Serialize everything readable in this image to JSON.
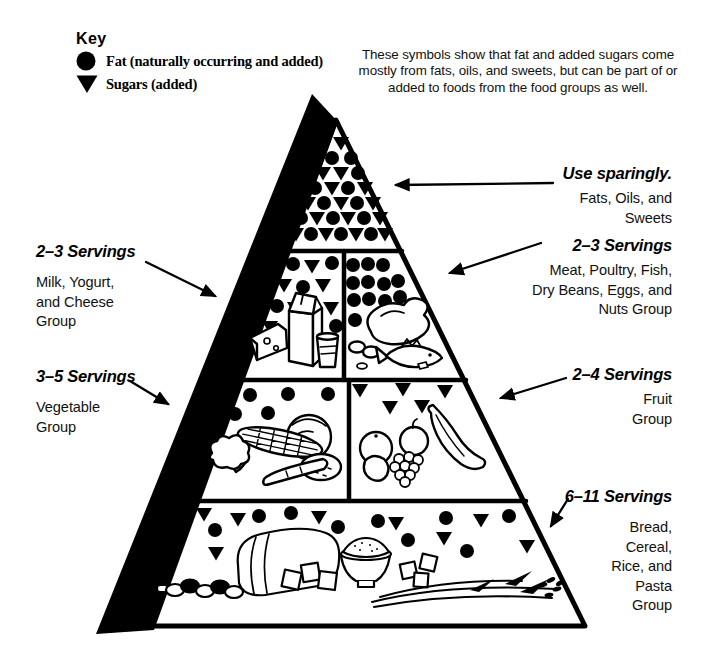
{
  "key": {
    "heading": "Key",
    "items": [
      {
        "icon": "fat-circle",
        "label": "Fat (naturally occurring and added)"
      },
      {
        "icon": "sugar-triangle",
        "label": "Sugars (added)"
      }
    ]
  },
  "note": "These symbols show that fat and added sugars come\nmostly from fats, oils, and sweets, but can be part of or\nadded to foods from the food groups as well.",
  "callouts": {
    "right": [
      {
        "id": "fats-oils-sweets",
        "servings": "Use sparingly.",
        "group": "Fats, Oils, and\nSweets"
      },
      {
        "id": "meat",
        "servings": "2–3 Servings",
        "group": "Meat, Poultry, Fish,\nDry Beans, Eggs, and\nNuts Group"
      },
      {
        "id": "fruit",
        "servings": "2–4 Servings",
        "group": "Fruit\nGroup"
      },
      {
        "id": "bread",
        "servings": "6–11 Servings",
        "group": "Bread,\nCereal,\nRice, and\nPasta\nGroup"
      }
    ],
    "left": [
      {
        "id": "milk",
        "servings": "2–3 Servings",
        "group": "Milk, Yogurt,\nand Cheese\nGroup"
      },
      {
        "id": "vegetable",
        "servings": "3–5 Servings",
        "group": "Vegetable\nGroup"
      }
    ]
  },
  "colors": {
    "ink": "#000000",
    "paper": "#ffffff"
  },
  "pyramid": {
    "sections": [
      {
        "id": "fats-oils-sweets",
        "symbols": [
          {
            "t": "sugar",
            "x": 341,
            "y": 143
          },
          {
            "t": "fat",
            "x": 332,
            "y": 158
          },
          {
            "t": "fat",
            "x": 351,
            "y": 158
          },
          {
            "t": "sugar",
            "x": 323,
            "y": 173
          },
          {
            "t": "sugar",
            "x": 341,
            "y": 173
          },
          {
            "t": "fat",
            "x": 358,
            "y": 173
          },
          {
            "t": "fat",
            "x": 315,
            "y": 188
          },
          {
            "t": "sugar",
            "x": 332,
            "y": 188
          },
          {
            "t": "fat",
            "x": 348,
            "y": 188
          },
          {
            "t": "sugar",
            "x": 365,
            "y": 188
          },
          {
            "t": "sugar",
            "x": 308,
            "y": 203
          },
          {
            "t": "fat",
            "x": 324,
            "y": 203
          },
          {
            "t": "sugar",
            "x": 341,
            "y": 203
          },
          {
            "t": "fat",
            "x": 357,
            "y": 203
          },
          {
            "t": "sugar",
            "x": 373,
            "y": 203
          },
          {
            "t": "fat",
            "x": 301,
            "y": 218
          },
          {
            "t": "sugar",
            "x": 317,
            "y": 218
          },
          {
            "t": "fat",
            "x": 333,
            "y": 218
          },
          {
            "t": "sugar",
            "x": 348,
            "y": 218
          },
          {
            "t": "fat",
            "x": 364,
            "y": 218
          },
          {
            "t": "sugar",
            "x": 380,
            "y": 218
          },
          {
            "t": "sugar",
            "x": 296,
            "y": 234
          },
          {
            "t": "fat",
            "x": 311,
            "y": 234
          },
          {
            "t": "sugar",
            "x": 326,
            "y": 234
          },
          {
            "t": "fat",
            "x": 341,
            "y": 234
          },
          {
            "t": "sugar",
            "x": 356,
            "y": 234
          },
          {
            "t": "fat",
            "x": 371,
            "y": 234
          },
          {
            "t": "sugar",
            "x": 385,
            "y": 234
          }
        ]
      },
      {
        "id": "milk-yogurt-cheese",
        "symbols": [
          {
            "t": "fat",
            "x": 293,
            "y": 264
          },
          {
            "t": "sugar",
            "x": 312,
            "y": 266
          },
          {
            "t": "fat",
            "x": 332,
            "y": 263
          },
          {
            "t": "sugar",
            "x": 284,
            "y": 285
          },
          {
            "t": "fat",
            "x": 303,
            "y": 287
          },
          {
            "t": "sugar",
            "x": 323,
            "y": 285
          },
          {
            "t": "fat",
            "x": 277,
            "y": 306
          },
          {
            "t": "sugar",
            "x": 295,
            "y": 308
          },
          {
            "t": "sugar",
            "x": 331,
            "y": 308
          },
          {
            "t": "sugar",
            "x": 270,
            "y": 327
          },
          {
            "t": "fat",
            "x": 336,
            "y": 326
          }
        ]
      },
      {
        "id": "meat-poultry-fish",
        "symbols": [
          {
            "t": "fat",
            "x": 353,
            "y": 265
          },
          {
            "t": "fat",
            "x": 368,
            "y": 264
          },
          {
            "t": "fat",
            "x": 383,
            "y": 265
          },
          {
            "t": "fat",
            "x": 353,
            "y": 283
          },
          {
            "t": "fat",
            "x": 368,
            "y": 282
          },
          {
            "t": "fat",
            "x": 384,
            "y": 284
          },
          {
            "t": "fat",
            "x": 398,
            "y": 281
          },
          {
            "t": "fat",
            "x": 354,
            "y": 300
          },
          {
            "t": "fat",
            "x": 369,
            "y": 299
          },
          {
            "t": "fat",
            "x": 385,
            "y": 301
          },
          {
            "t": "fat",
            "x": 400,
            "y": 297
          },
          {
            "t": "fat",
            "x": 355,
            "y": 320
          },
          {
            "t": "fat",
            "x": 411,
            "y": 305
          }
        ]
      },
      {
        "id": "vegetable",
        "symbols": [
          {
            "t": "fat",
            "x": 250,
            "y": 395
          },
          {
            "t": "fat",
            "x": 288,
            "y": 394
          },
          {
            "t": "fat",
            "x": 328,
            "y": 394
          },
          {
            "t": "fat",
            "x": 235,
            "y": 414
          },
          {
            "t": "fat",
            "x": 268,
            "y": 413
          }
        ]
      },
      {
        "id": "fruit",
        "symbols": [
          {
            "t": "sugar",
            "x": 360,
            "y": 390
          },
          {
            "t": "sugar",
            "x": 403,
            "y": 389
          },
          {
            "t": "sugar",
            "x": 445,
            "y": 391
          },
          {
            "t": "sugar",
            "x": 390,
            "y": 407
          },
          {
            "t": "sugar",
            "x": 422,
            "y": 406
          }
        ]
      },
      {
        "id": "bread-cereal-rice-pasta",
        "symbols": [
          {
            "t": "sugar",
            "x": 204,
            "y": 514
          },
          {
            "t": "sugar",
            "x": 238,
            "y": 519
          },
          {
            "t": "fat",
            "x": 259,
            "y": 516
          },
          {
            "t": "fat",
            "x": 291,
            "y": 513
          },
          {
            "t": "sugar",
            "x": 319,
            "y": 517
          },
          {
            "t": "fat",
            "x": 215,
            "y": 530
          },
          {
            "t": "sugar",
            "x": 216,
            "y": 553
          },
          {
            "t": "fat",
            "x": 338,
            "y": 527
          },
          {
            "t": "fat",
            "x": 378,
            "y": 521
          },
          {
            "t": "sugar",
            "x": 396,
            "y": 523
          },
          {
            "t": "fat",
            "x": 408,
            "y": 540
          },
          {
            "t": "fat",
            "x": 446,
            "y": 518
          },
          {
            "t": "sugar",
            "x": 481,
            "y": 520
          },
          {
            "t": "fat",
            "x": 509,
            "y": 516
          },
          {
            "t": "sugar",
            "x": 444,
            "y": 538
          },
          {
            "t": "fat",
            "x": 467,
            "y": 551
          },
          {
            "t": "sugar",
            "x": 527,
            "y": 546
          }
        ]
      }
    ]
  }
}
